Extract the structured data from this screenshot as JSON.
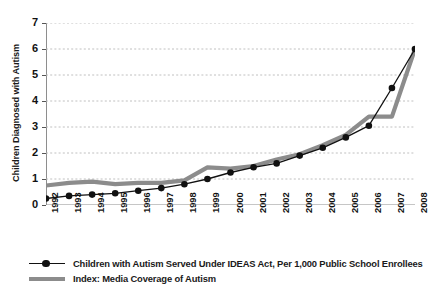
{
  "chart_data": {
    "type": "line",
    "title": "",
    "xlabel": "",
    "ylabel": "Children Diagnosed with Autism",
    "categories": [
      "1992",
      "1993",
      "1994",
      "1995",
      "1996",
      "1997",
      "1998",
      "1999",
      "2000",
      "2001",
      "2002",
      "2003",
      "2004",
      "2005",
      "2006",
      "2007",
      "2008"
    ],
    "ylim": [
      0,
      7
    ],
    "yticks": [
      0,
      1,
      2,
      3,
      4,
      5,
      6,
      7
    ],
    "grid": true,
    "legend_position": "bottom-left",
    "series": [
      {
        "name": "Children with Autism Served Under IDEAS Act, Per 1,000 Public School Enrollees",
        "color": "#111111",
        "marker": "circle",
        "values": [
          0.25,
          0.35,
          0.4,
          0.45,
          0.55,
          0.65,
          0.8,
          1.0,
          1.25,
          1.45,
          1.6,
          1.9,
          2.2,
          2.6,
          3.05,
          4.5,
          6.0
        ]
      },
      {
        "name": "Index: Media Coverage of Autism",
        "color": "#8c8c8c",
        "marker": "none",
        "values": [
          0.75,
          0.85,
          0.9,
          0.8,
          0.85,
          0.85,
          0.95,
          1.45,
          1.4,
          1.5,
          1.75,
          1.95,
          2.3,
          2.7,
          3.4,
          3.4,
          6.0
        ]
      }
    ]
  },
  "legend": {
    "items": [
      {
        "label": "Children with Autism Served Under IDEAS Act, Per 1,000 Public School Enrollees"
      },
      {
        "label": "Index: Media Coverage of Autism"
      }
    ]
  }
}
